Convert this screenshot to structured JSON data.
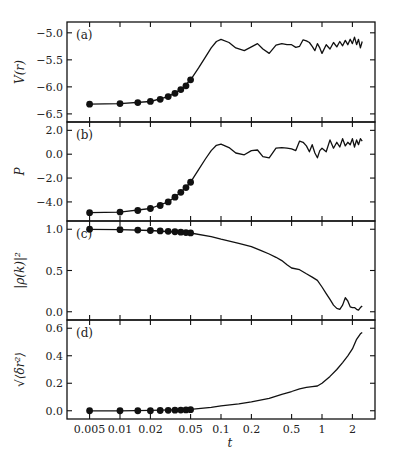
{
  "chart_data": [
    {
      "type": "line",
      "panel": "(a)",
      "ylabel": "V(r)",
      "xlabel": "t",
      "xscale": "log",
      "xlim": [
        0.0035,
        2.8
      ],
      "ylim": [
        -6.65,
        -4.8
      ],
      "yticks": [
        -5.0,
        -5.5,
        -6.0,
        -6.5
      ],
      "ytick_labels": [
        "−5.0",
        "−5.5",
        "−6.0",
        "−6.5"
      ],
      "markers": {
        "x": [
          0.005,
          0.01,
          0.015,
          0.02,
          0.025,
          0.03,
          0.035,
          0.04,
          0.045,
          0.05
        ],
        "y": [
          -6.32,
          -6.31,
          -6.29,
          -6.27,
          -6.23,
          -6.18,
          -6.12,
          -6.05,
          -5.98,
          -5.87
        ]
      },
      "curve": {
        "x": [
          0.005,
          0.01,
          0.02,
          0.03,
          0.04,
          0.05,
          0.06,
          0.07,
          0.08,
          0.09,
          0.1,
          0.12,
          0.14,
          0.17,
          0.2,
          0.23,
          0.26,
          0.3,
          0.35,
          0.4,
          0.45,
          0.5,
          0.55,
          0.6,
          0.65,
          0.7,
          0.75,
          0.8,
          0.85,
          0.9,
          0.95,
          1.0,
          1.1,
          1.2,
          1.3,
          1.4,
          1.5,
          1.6,
          1.7,
          1.8,
          1.9,
          2.0,
          2.1,
          2.2,
          2.3,
          2.4,
          2.5
        ],
        "y": [
          -6.32,
          -6.31,
          -6.27,
          -6.18,
          -6.05,
          -5.87,
          -5.65,
          -5.45,
          -5.28,
          -5.16,
          -5.12,
          -5.18,
          -5.28,
          -5.33,
          -5.26,
          -5.2,
          -5.3,
          -5.38,
          -5.23,
          -5.2,
          -5.22,
          -5.22,
          -5.27,
          -5.25,
          -5.13,
          -5.15,
          -5.18,
          -5.25,
          -5.33,
          -5.2,
          -5.28,
          -5.38,
          -5.22,
          -5.3,
          -5.18,
          -5.26,
          -5.16,
          -5.24,
          -5.14,
          -5.22,
          -5.12,
          -5.2,
          -5.08,
          -5.22,
          -5.12,
          -5.28,
          -5.16
        ]
      }
    },
    {
      "type": "line",
      "panel": "(b)",
      "ylabel": "P",
      "xlabel": "t",
      "xscale": "log",
      "xlim": [
        0.0035,
        2.8
      ],
      "ylim": [
        -5.6,
        2.7
      ],
      "yticks": [
        2.0,
        0.0,
        -2.0,
        -4.0
      ],
      "ytick_labels": [
        "2.0",
        "0.0",
        "−2.0",
        "−4.0"
      ],
      "markers": {
        "x": [
          0.005,
          0.01,
          0.015,
          0.02,
          0.025,
          0.03,
          0.035,
          0.04,
          0.045,
          0.05
        ],
        "y": [
          -4.9,
          -4.85,
          -4.72,
          -4.55,
          -4.3,
          -4.0,
          -3.6,
          -3.2,
          -2.8,
          -2.35
        ]
      },
      "curve": {
        "x": [
          0.005,
          0.01,
          0.02,
          0.03,
          0.04,
          0.05,
          0.06,
          0.07,
          0.08,
          0.09,
          0.1,
          0.12,
          0.14,
          0.17,
          0.2,
          0.23,
          0.26,
          0.3,
          0.35,
          0.4,
          0.45,
          0.5,
          0.55,
          0.6,
          0.65,
          0.7,
          0.75,
          0.8,
          0.85,
          0.9,
          0.95,
          1.0,
          1.1,
          1.2,
          1.3,
          1.4,
          1.5,
          1.6,
          1.7,
          1.8,
          1.9,
          2.0,
          2.1,
          2.2,
          2.3,
          2.4,
          2.5
        ],
        "y": [
          -4.9,
          -4.85,
          -4.55,
          -4.0,
          -3.2,
          -2.35,
          -1.3,
          -0.4,
          0.3,
          0.75,
          0.85,
          0.55,
          0.1,
          -0.05,
          0.3,
          0.35,
          -0.2,
          -0.3,
          0.5,
          0.55,
          0.5,
          0.45,
          0.3,
          1.1,
          1.0,
          0.7,
          0.2,
          0.8,
          0.1,
          -0.3,
          0.3,
          0.5,
          0.2,
          1.2,
          0.5,
          1.0,
          0.6,
          1.3,
          0.7,
          1.0,
          0.8,
          1.3,
          0.6,
          1.2,
          0.8,
          1.3,
          1.1
        ]
      }
    },
    {
      "type": "line",
      "panel": "(c)",
      "ylabel": "|ρ(k)|²",
      "xlabel": "t",
      "xscale": "log",
      "xlim": [
        0.0035,
        2.8
      ],
      "ylim": [
        -0.1,
        1.1
      ],
      "yticks": [
        1.0,
        0.5,
        0.0
      ],
      "ytick_labels": [
        "1.0",
        "0.5",
        "0.0"
      ],
      "markers": {
        "x": [
          0.005,
          0.01,
          0.015,
          0.02,
          0.025,
          0.03,
          0.035,
          0.04,
          0.045,
          0.05
        ],
        "y": [
          1.0,
          0.995,
          0.99,
          0.985,
          0.98,
          0.975,
          0.97,
          0.965,
          0.96,
          0.955
        ]
      },
      "curve": {
        "x": [
          0.005,
          0.01,
          0.02,
          0.05,
          0.08,
          0.1,
          0.15,
          0.2,
          0.25,
          0.3,
          0.35,
          0.4,
          0.45,
          0.5,
          0.6,
          0.7,
          0.8,
          0.9,
          1.0,
          1.1,
          1.2,
          1.3,
          1.4,
          1.5,
          1.6,
          1.7,
          1.8,
          1.9,
          2.0,
          2.1,
          2.2,
          2.3,
          2.4,
          2.5
        ],
        "y": [
          1.0,
          0.995,
          0.985,
          0.955,
          0.91,
          0.88,
          0.83,
          0.79,
          0.74,
          0.7,
          0.66,
          0.62,
          0.57,
          0.53,
          0.51,
          0.46,
          0.42,
          0.38,
          0.3,
          0.22,
          0.15,
          0.08,
          0.04,
          0.03,
          0.08,
          0.17,
          0.13,
          0.06,
          0.05,
          0.05,
          0.03,
          0.02,
          0.05,
          0.07
        ]
      }
    },
    {
      "type": "line",
      "panel": "(d)",
      "ylabel": "√⟨δr²⟩",
      "xlabel": "t",
      "xscale": "log",
      "xlim": [
        0.0035,
        2.8
      ],
      "ylim": [
        -0.06,
        0.66
      ],
      "yticks": [
        0.6,
        0.4,
        0.2,
        0.0
      ],
      "ytick_labels": [
        "0.6",
        "0.4",
        "0.2",
        "0.0"
      ],
      "xticks": [
        0.005,
        0.01,
        0.02,
        0.05,
        0.1,
        0.2,
        0.5,
        1,
        2
      ],
      "xtick_labels": [
        "0.005",
        "0.01",
        "0.02",
        "0.05",
        "0.1",
        "0.2",
        "0.5",
        "1",
        "2"
      ],
      "markers": {
        "x": [
          0.005,
          0.01,
          0.015,
          0.02,
          0.025,
          0.03,
          0.035,
          0.04,
          0.045,
          0.05
        ],
        "y": [
          0.0,
          0.0,
          0.0,
          0.0,
          0.002,
          0.003,
          0.004,
          0.005,
          0.006,
          0.008
        ]
      },
      "curve": {
        "x": [
          0.005,
          0.01,
          0.02,
          0.05,
          0.08,
          0.1,
          0.15,
          0.2,
          0.3,
          0.4,
          0.5,
          0.6,
          0.7,
          0.8,
          0.9,
          1.0,
          1.2,
          1.4,
          1.6,
          1.8,
          2.0,
          2.2,
          2.4,
          2.5
        ],
        "y": [
          0.0,
          0.0,
          0.003,
          0.01,
          0.025,
          0.035,
          0.05,
          0.065,
          0.09,
          0.12,
          0.14,
          0.16,
          0.17,
          0.175,
          0.18,
          0.2,
          0.25,
          0.3,
          0.35,
          0.4,
          0.45,
          0.52,
          0.56,
          0.57
        ]
      }
    }
  ],
  "figure": {
    "xlabel": "t",
    "panel_labels": [
      "(a)",
      "(b)",
      "(c)",
      "(d)"
    ],
    "ylabels": [
      "V(r)",
      "P",
      "|ρ(k)|²",
      "√⟨δr²⟩"
    ]
  }
}
